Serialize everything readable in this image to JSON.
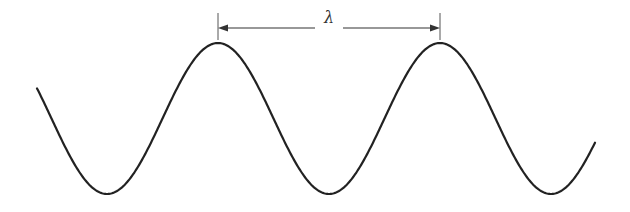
{
  "diagram": {
    "type": "sine-wave-wavelength",
    "wavelength_label": "λ",
    "colors": {
      "stroke": "#222222",
      "background": "#ffffff"
    },
    "wave": {
      "x_start": 37,
      "x_end": 595,
      "center_y": 118.5,
      "amplitude": 75.5,
      "wavelength_px": 222,
      "peak_x": [
        218,
        440
      ],
      "trough_x": [
        107,
        329,
        551
      ]
    },
    "dimension_line": {
      "y": 28,
      "x1": 218,
      "x2": 440,
      "tick_top": 13,
      "tick_bottom": 40
    }
  }
}
